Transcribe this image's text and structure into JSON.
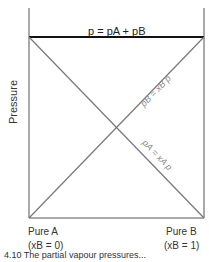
{
  "diagram": {
    "y_axis_label": "Pressure",
    "total_pressure_label": "p = pA + pB",
    "line_B_label": "pB = xB p",
    "line_A_label": "pA = xA p",
    "left_end": {
      "name": "Pure A",
      "composition": "(xB = 0)"
    },
    "right_end": {
      "name": "Pure B",
      "composition": "(xB = 1)"
    },
    "caption": "4.10 The partial vapour pressures..."
  }
}
